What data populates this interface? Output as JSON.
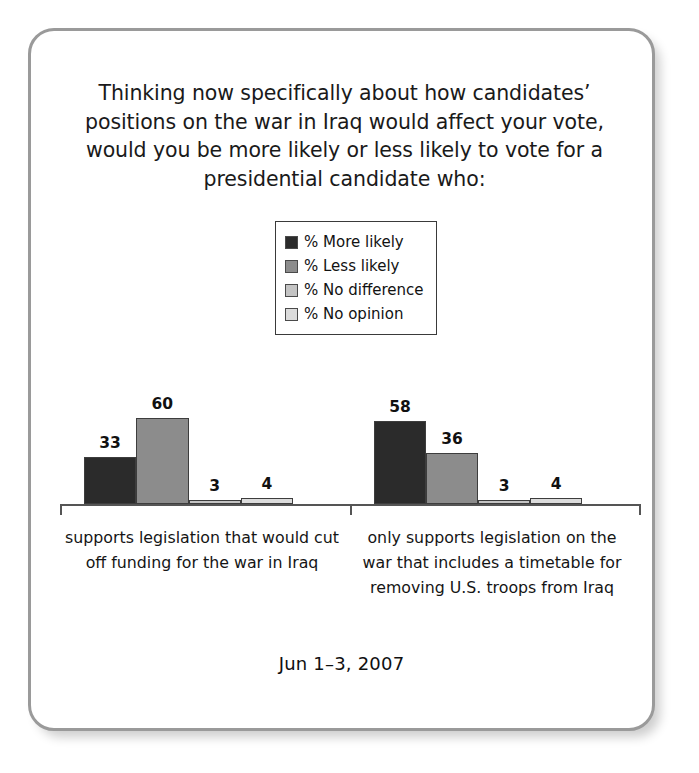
{
  "card": {
    "question": "Thinking now specifically about how candidates’ positions on the war in Iraq would affect your vote, would you be more likely or less likely to vote for a presidential candidate who:",
    "footer_date": "Jun 1–3, 2007"
  },
  "legend": {
    "items": [
      {
        "label": "% More likely",
        "color": "#2b2b2b"
      },
      {
        "label": "% Less likely",
        "color": "#8c8c8c"
      },
      {
        "label": "% No difference",
        "color": "#c4c4c4"
      },
      {
        "label": "% No opinion",
        "color": "#dcdcdc"
      }
    ]
  },
  "chart_data": {
    "type": "bar",
    "title": "Thinking now specifically about how candidates’ positions on the war in Iraq would affect your vote, would you be more likely or less likely to vote for a presidential candidate who:",
    "xlabel": "",
    "ylabel": "",
    "ylim": [
      0,
      100
    ],
    "grid": false,
    "legend_position": "top-center",
    "categories": [
      "supports legislation that would cut off funding for the war in Iraq",
      "only supports legislation on the war that includes a timetable for removing U.S. troops from Iraq"
    ],
    "series": [
      {
        "name": "% More likely",
        "color": "#2b2b2b",
        "values": [
          33,
          58
        ]
      },
      {
        "name": "% Less likely",
        "color": "#8c8c8c",
        "values": [
          60,
          36
        ]
      },
      {
        "name": "% No difference",
        "color": "#c4c4c4",
        "values": [
          3,
          3
        ]
      },
      {
        "name": "% No opinion",
        "color": "#dcdcdc",
        "values": [
          4,
          4
        ]
      }
    ],
    "data_labels": [
      [
        33,
        60,
        3,
        4
      ],
      [
        58,
        36,
        3,
        4
      ]
    ],
    "annotations": {
      "date": "Jun 1–3, 2007"
    }
  }
}
